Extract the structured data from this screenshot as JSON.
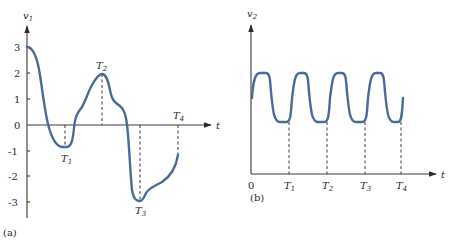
{
  "colors": {
    "curve": "#4a6a9a",
    "axis": "#3a3a3a",
    "text": "#2a2a2a"
  },
  "panel_a": {
    "caption": "(a)",
    "y_axis_label": "v",
    "y_axis_sub": "1",
    "x_axis_label": "t",
    "y_ticks": [
      "3",
      "2",
      "1",
      "0",
      "-1",
      "-2",
      "-3"
    ],
    "markers": [
      {
        "label": "T",
        "sub": "1"
      },
      {
        "label": "T",
        "sub": "2"
      },
      {
        "label": "T",
        "sub": "3"
      },
      {
        "label": "T",
        "sub": "4"
      }
    ]
  },
  "panel_b": {
    "caption": "(b)",
    "y_axis_label": "v",
    "y_axis_sub": "2",
    "x_axis_label": "t",
    "origin_label": "0",
    "markers": [
      {
        "label": "T",
        "sub": "1"
      },
      {
        "label": "T",
        "sub": "2"
      },
      {
        "label": "T",
        "sub": "3"
      },
      {
        "label": "T",
        "sub": "4"
      }
    ]
  }
}
